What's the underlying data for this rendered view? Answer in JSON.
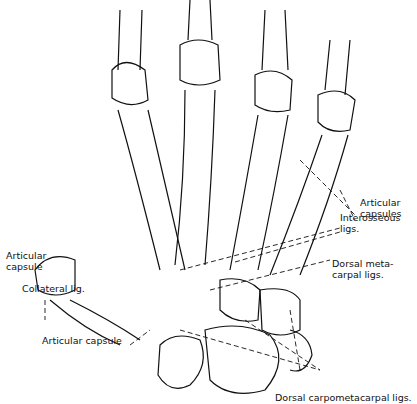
{
  "diagram": {
    "labels": {
      "articular_capsules": "Articular\ncapsules",
      "interosseous_ligs": "Interosseous\nligs.",
      "dorsal_metacarpal_ligs": "Dorsal meta-\ncarpal ligs.",
      "articular_capsule_left": "Articular\ncapsule",
      "collateral_lig": "Collateral lig.",
      "articular_capsule_bottom": "Articular capsule",
      "dorsal_carpometacarpal_ligs": "Dorsal carpometacarpal ligs."
    },
    "colors": {
      "line": "#111111",
      "background": "#ffffff"
    }
  }
}
